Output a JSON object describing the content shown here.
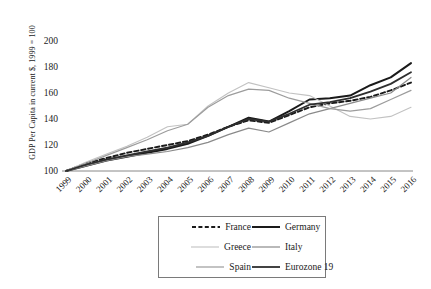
{
  "chart_data": {
    "type": "line",
    "title": "",
    "xlabel": "",
    "ylabel": "GDP Per Capita in current $, 1999 = 100",
    "x": [
      1999,
      2000,
      2001,
      2002,
      2003,
      2004,
      2005,
      2006,
      2007,
      2008,
      2009,
      2010,
      2011,
      2012,
      2013,
      2014,
      2015,
      2016
    ],
    "categories": [
      "1999",
      "2000",
      "2001",
      "2002",
      "2003",
      "2004",
      "2005",
      "2006",
      "2007",
      "2008",
      "2009",
      "2010",
      "2011",
      "2012",
      "2013",
      "2014",
      "2015",
      "2016"
    ],
    "ylim": [
      100,
      205
    ],
    "yticks": [
      100,
      120,
      140,
      160,
      180,
      200
    ],
    "grid": false,
    "legend_position": "bottom-center",
    "series": [
      {
        "name": "France",
        "style": "dashed",
        "color": "#1a1a1a",
        "width": 1.9,
        "values": [
          100,
          106,
          110,
          114,
          117,
          120,
          123,
          128,
          134,
          139,
          137,
          143,
          149,
          152,
          154,
          157,
          162,
          168
        ]
      },
      {
        "name": "Germany",
        "style": "solid",
        "color": "#1a1a1a",
        "width": 2.0,
        "values": [
          100,
          104,
          108,
          111,
          114,
          117,
          121,
          127,
          134,
          141,
          138,
          146,
          155,
          156,
          158,
          166,
          172,
          183
        ]
      },
      {
        "name": "Greece",
        "style": "solid",
        "color": "#c2c2c2",
        "width": 1.1,
        "values": [
          100,
          107,
          113,
          119,
          126,
          134,
          136,
          150,
          160,
          168,
          164,
          160,
          158,
          150,
          142,
          140,
          142,
          149
        ]
      },
      {
        "name": "Italy",
        "style": "solid",
        "color": "#8a8a8a",
        "width": 1.2,
        "values": [
          100,
          104,
          108,
          111,
          113,
          115,
          118,
          122,
          128,
          133,
          130,
          137,
          144,
          148,
          152,
          156,
          160,
          172
        ]
      },
      {
        "name": "Spain",
        "style": "solid",
        "color": "#9c9c9c",
        "width": 1.2,
        "values": [
          100,
          106,
          112,
          118,
          124,
          131,
          136,
          149,
          158,
          163,
          162,
          156,
          152,
          148,
          146,
          148,
          155,
          162
        ]
      },
      {
        "name": "Eurozone 19",
        "style": "solid",
        "color": "#2e2e2e",
        "width": 1.8,
        "values": [
          100,
          105,
          109,
          112,
          115,
          118,
          122,
          127,
          134,
          140,
          138,
          144,
          151,
          153,
          156,
          161,
          167,
          176
        ]
      }
    ]
  },
  "legend": {
    "entries": [
      {
        "label": "France"
      },
      {
        "label": "Germany"
      },
      {
        "label": "Greece"
      },
      {
        "label": "Italy"
      },
      {
        "label": "Spain"
      },
      {
        "label": "Eurozone 19"
      }
    ]
  }
}
